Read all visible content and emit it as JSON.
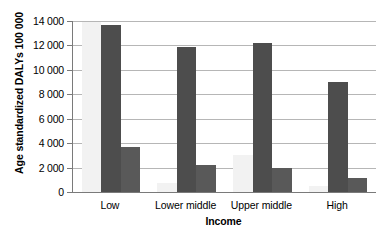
{
  "chart_data": {
    "type": "bar",
    "title": "",
    "xlabel": "Income",
    "ylabel": "Age standardized DALYs 100 000",
    "categories": [
      "Low",
      "Lower middle",
      "Upper middle",
      "High"
    ],
    "series": [
      {
        "name": "series-1",
        "color": "#f2f2f2",
        "values": [
          13950,
          700,
          3000,
          520
        ]
      },
      {
        "name": "series-2",
        "color": "#4d4d4d",
        "values": [
          13700,
          11850,
          12200,
          9000
        ]
      },
      {
        "name": "series-3",
        "color": "#595959",
        "values": [
          3700,
          2250,
          1950,
          1150
        ]
      }
    ],
    "ylim": [
      0,
      14000
    ],
    "yticks": [
      0,
      2000,
      4000,
      6000,
      8000,
      10000,
      12000,
      14000
    ],
    "ytick_labels": [
      "0",
      "2 000",
      "4 000",
      "6 000",
      "8 000",
      "10 000",
      "12 000",
      "14 000"
    ],
    "grid": true,
    "legend": "none"
  },
  "axes": {
    "y_title": "Age standardized DALYs 100 000",
    "x_title": "Income"
  }
}
